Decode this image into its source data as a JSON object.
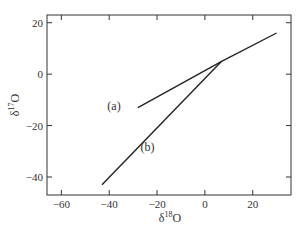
{
  "chart_data": {
    "type": "line",
    "title": "",
    "xlabel": "δ18O",
    "ylabel": "δ17O",
    "xlabel_parts": {
      "base": "δ",
      "sup": "18",
      "tail": "O"
    },
    "ylabel_parts": {
      "base": "δ",
      "sup": "17",
      "tail": "O"
    },
    "xlim": [
      -66,
      36
    ],
    "ylim": [
      -47,
      23
    ],
    "xticks": [
      -60,
      -40,
      -20,
      0,
      20
    ],
    "yticks": [
      -40,
      -20,
      0,
      20
    ],
    "xtick_labels": [
      "−60",
      "−40",
      "−20",
      "0",
      "20"
    ],
    "ytick_labels": [
      "−40",
      "−20",
      "0",
      "20"
    ],
    "grid": false,
    "legend": "none",
    "series": [
      {
        "name": "(a)",
        "points": [
          [
            -28,
            -13
          ],
          [
            7,
            5
          ],
          [
            30,
            16
          ]
        ]
      },
      {
        "name": "(b)",
        "points": [
          [
            -43,
            -43
          ],
          [
            7,
            5
          ]
        ]
      }
    ],
    "annotations": [
      {
        "text": "(a)",
        "x": -38,
        "y": -14
      },
      {
        "text": "(b)",
        "x": -24,
        "y": -30
      }
    ],
    "color": "#222222"
  }
}
